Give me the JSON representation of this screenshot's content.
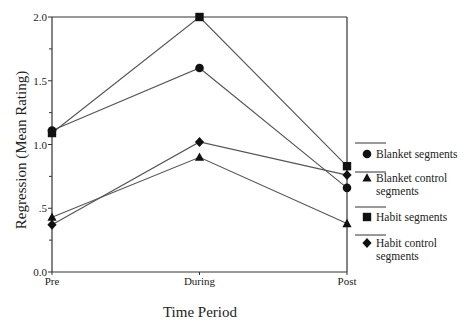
{
  "chart_data": {
    "type": "line",
    "title": "",
    "xlabel": "Time Period",
    "ylabel": "Regression (Mean Rating)",
    "categories": [
      "Pre",
      "During",
      "Post"
    ],
    "ylim": [
      0.0,
      2.0
    ],
    "yticks": [
      {
        "value": 0.0,
        "label": "0.0"
      },
      {
        "value": 0.5,
        "label": ".5"
      },
      {
        "value": 1.0,
        "label": "1.0"
      },
      {
        "value": 1.5,
        "label": "1.5"
      },
      {
        "value": 2.0,
        "label": "2.0"
      }
    ],
    "grid": false,
    "legend_position": "right",
    "series": [
      {
        "name": "Blanket segments",
        "label_lines": [
          "Blanket segments"
        ],
        "marker": "circle",
        "values": [
          1.11,
          1.6,
          0.66
        ]
      },
      {
        "name": "Blanket control segments",
        "label_lines": [
          "Blanket control",
          "segments"
        ],
        "marker": "triangle",
        "values": [
          0.43,
          0.9,
          0.38
        ]
      },
      {
        "name": "Habit segments",
        "label_lines": [
          "Habit segments"
        ],
        "marker": "square",
        "values": [
          1.09,
          2.0,
          0.83
        ]
      },
      {
        "name": "Habit control segments",
        "label_lines": [
          "Habit control",
          "segments"
        ],
        "marker": "diamond",
        "values": [
          0.37,
          1.02,
          0.76
        ]
      }
    ],
    "colors": {
      "line": "#555555",
      "marker": "#111111",
      "axis": "#333333"
    }
  }
}
